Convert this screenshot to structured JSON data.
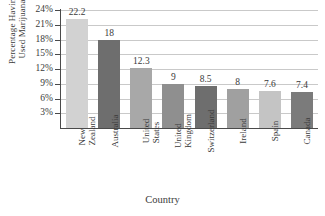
{
  "chart_data": {
    "type": "bar",
    "title": "",
    "xlabel": "Country",
    "ylabel_lines": [
      "Percentage Having",
      "Used Marijuana"
    ],
    "ylabel": "Percentage Having Used Marijuana",
    "categories": [
      "New Zealand",
      "Australia",
      "United States",
      "United Kingdom",
      "Switzerland",
      "Ireland",
      "Spain",
      "Canada"
    ],
    "category_lines": [
      [
        "New",
        "Zealand"
      ],
      [
        "Australia"
      ],
      [
        "United",
        "States"
      ],
      [
        "United",
        "Kingdom"
      ],
      [
        "Switzerland"
      ],
      [
        "Ireland"
      ],
      [
        "Spain"
      ],
      [
        "Canada"
      ]
    ],
    "values": [
      22.2,
      18,
      12.3,
      9,
      8.5,
      8,
      7.6,
      7.4
    ],
    "value_labels": [
      "22.2",
      "18",
      "12.3",
      "9",
      "8.5",
      "8",
      "7.6",
      "7.4"
    ],
    "bar_colors": [
      "#d2d2d2",
      "#6e6e6e",
      "#a8a8a8",
      "#8f8f8f",
      "#6e6e6e",
      "#a0a0a0",
      "#c4c4c4",
      "#7b7b7b"
    ],
    "ylim": [
      0,
      24
    ],
    "yticks": [
      3,
      6,
      9,
      12,
      15,
      18,
      21,
      24
    ],
    "ytick_labels": [
      "3%",
      "6%",
      "9%",
      "12%",
      "15%",
      "18%",
      "21%",
      "24%"
    ],
    "grid": true,
    "grid_color": "#c9c9c9",
    "legend": "none",
    "axis_color": "#4a4a4a",
    "background": "#ffffff"
  }
}
